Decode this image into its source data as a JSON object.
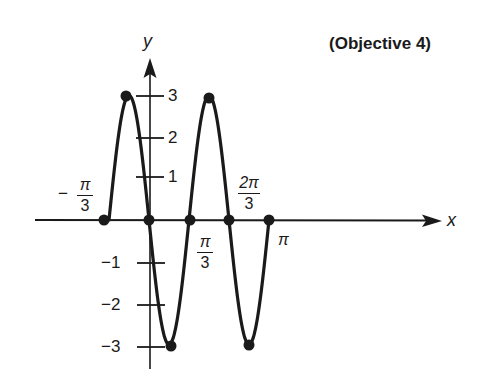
{
  "title": "(Objective 4)",
  "axes": {
    "x_label": "x",
    "y_label": "y"
  },
  "x_ticks": [
    {
      "id": "neg_pi_3",
      "sign": "−",
      "num": "π",
      "den": "3"
    },
    {
      "id": "pi_3",
      "num": "π",
      "den": "3"
    },
    {
      "id": "two_pi_3",
      "num": "2π",
      "den": "3"
    },
    {
      "id": "pi",
      "text": "π"
    }
  ],
  "y_ticks": [
    "3",
    "2",
    "1",
    "−1",
    "−2",
    "−3"
  ],
  "chart_data": {
    "type": "line",
    "title": "(Objective 4)",
    "xlabel": "x",
    "ylabel": "y",
    "function": "y = -3 sin(3x)",
    "xlim": [
      "-π/3",
      "π"
    ],
    "ylim": [
      -3,
      3
    ],
    "x_tick_labels": [
      "-π/3",
      "π/3",
      "2π/3",
      "π"
    ],
    "y_tick_labels": [
      "-3",
      "-2",
      "-1",
      "1",
      "2",
      "3"
    ],
    "grid": false,
    "legend": null,
    "marked_points": [
      {
        "x": "-π/3",
        "y": 0
      },
      {
        "x": "-π/6",
        "y": 3
      },
      {
        "x": "0",
        "y": 0
      },
      {
        "x": "π/6",
        "y": -3
      },
      {
        "x": "π/3",
        "y": 0
      },
      {
        "x": "π/2",
        "y": 3
      },
      {
        "x": "2π/3",
        "y": 0
      },
      {
        "x": "5π/6",
        "y": -3
      },
      {
        "x": "π",
        "y": 0
      }
    ],
    "x_numeric": [
      -1.0472,
      -0.5236,
      0,
      0.5236,
      1.0472,
      1.5708,
      2.0944,
      2.618,
      3.1416
    ],
    "y_values": [
      0,
      3,
      0,
      -3,
      0,
      3,
      0,
      -3,
      0
    ]
  },
  "colors": {
    "ink": "#1a1a1a",
    "background": "#ffffff"
  }
}
